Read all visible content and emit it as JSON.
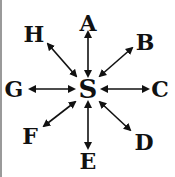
{
  "diagram": {
    "center": {
      "label": "S",
      "x": 88,
      "y": 89
    },
    "nodes": [
      {
        "label": "A",
        "x": 88,
        "y": 23,
        "ax": 88,
        "ay": 32,
        "bx": 88,
        "by": 76
      },
      {
        "label": "B",
        "x": 145,
        "y": 42,
        "ax": 132,
        "ay": 48,
        "bx": 100,
        "by": 76
      },
      {
        "label": "C",
        "x": 160,
        "y": 89,
        "ax": 148,
        "ay": 89,
        "bx": 102,
        "by": 89
      },
      {
        "label": "D",
        "x": 144,
        "y": 142,
        "ax": 130,
        "ay": 130,
        "bx": 100,
        "by": 102
      },
      {
        "label": "E",
        "x": 88,
        "y": 161,
        "ax": 88,
        "ay": 148,
        "bx": 88,
        "by": 102
      },
      {
        "label": "F",
        "x": 30,
        "y": 136,
        "ax": 44,
        "ay": 126,
        "bx": 75,
        "by": 102
      },
      {
        "label": "G",
        "x": 14,
        "y": 89,
        "ax": 30,
        "ay": 89,
        "bx": 74,
        "by": 89
      },
      {
        "label": "H",
        "x": 34,
        "y": 34,
        "ax": 48,
        "ay": 44,
        "bx": 76,
        "by": 76
      }
    ],
    "colors": {
      "ink": "#111111",
      "edge": "#9a9a9a",
      "background": "#ffffff"
    }
  }
}
